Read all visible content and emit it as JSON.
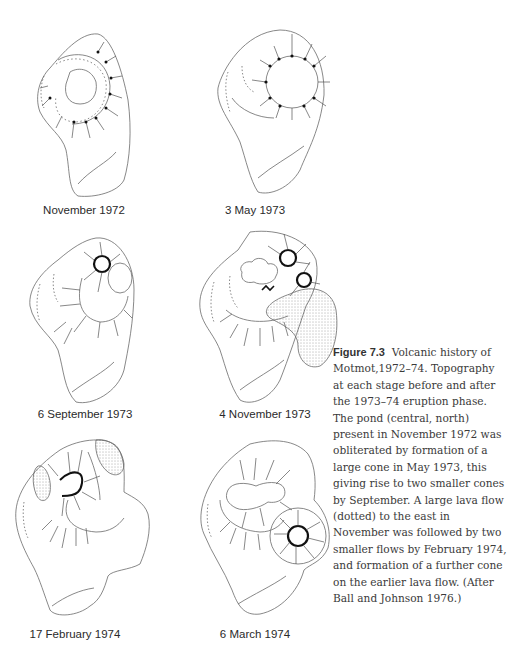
{
  "figure": {
    "number": "Figure 7.3",
    "caption": "Volcanic history of Motmot,1972–74. Topography at each stage before and after the 1973–74 eruption phase. The pond (central, north) present in November 1972 was obliterated by formation of a large cone in May 1973, this giving rise to two smaller cones by September. A large lava flow (dotted) to the east in November was followed by two smaller flows by February 1974, and formation of a further cone on the earlier lava flow. (After Ball and Johnson 1976.)"
  },
  "panels": [
    {
      "label": "November 1972",
      "feature": "crater pond"
    },
    {
      "label": "3 May 1973",
      "feature": "large cone"
    },
    {
      "label": "6 September 1973",
      "feature": "two smaller cones"
    },
    {
      "label": "4 November 1973",
      "feature": "large lava flow (dotted) to east"
    },
    {
      "label": "17 February 1974",
      "feature": "two smaller lava flows"
    },
    {
      "label": "6 March 1974",
      "feature": "further cone on earlier lava flow"
    }
  ],
  "legend": {
    "dotted_area": "lava flow",
    "hachured_circle": "cone / crater rim"
  }
}
